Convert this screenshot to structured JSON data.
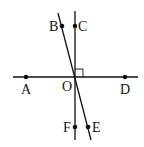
{
  "diagram": {
    "type": "geometry-lines",
    "points": {
      "A": {
        "label": "A",
        "x": 26,
        "y": 77
      },
      "B": {
        "label": "B",
        "x": 62,
        "y": 26
      },
      "C": {
        "label": "C",
        "x": 75,
        "y": 26
      },
      "D": {
        "label": "D",
        "x": 125,
        "y": 77
      },
      "O": {
        "label": "O",
        "x": 75,
        "y": 77
      },
      "E": {
        "label": "E",
        "x": 88,
        "y": 127
      },
      "F": {
        "label": "F",
        "x": 75,
        "y": 127
      }
    },
    "lines": [
      "AD",
      "CF",
      "BE"
    ],
    "right_angle": "COD",
    "color": "#111111"
  }
}
